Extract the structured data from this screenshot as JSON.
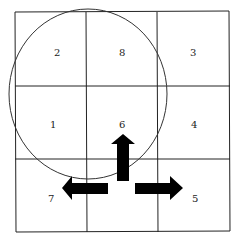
{
  "diagram": {
    "grid": {
      "rows": 3,
      "cols": 3
    },
    "cells": [
      {
        "label": "2",
        "row": 0,
        "col": 0
      },
      {
        "label": "8",
        "row": 0,
        "col": 1
      },
      {
        "label": "3",
        "row": 0,
        "col": 2
      },
      {
        "label": "1",
        "row": 1,
        "col": 0
      },
      {
        "label": "6",
        "row": 1,
        "col": 1
      },
      {
        "label": "4",
        "row": 1,
        "col": 2
      },
      {
        "label": "7",
        "row": 2,
        "col": 0
      },
      {
        "label": "5",
        "row": 2,
        "col": 2
      }
    ],
    "arrows": [
      {
        "direction": "up",
        "name": "arrow-up"
      },
      {
        "direction": "left",
        "name": "arrow-left"
      },
      {
        "direction": "right",
        "name": "arrow-right"
      }
    ],
    "circle": "ellipse-enclosing-cells-2-8-1-6"
  }
}
